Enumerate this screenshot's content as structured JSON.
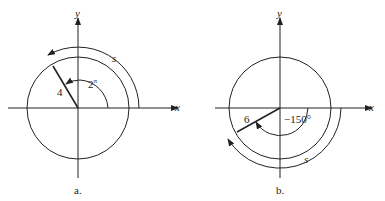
{
  "figure_a": {
    "caption": "a.",
    "x_label": "x",
    "y_label": "y",
    "radius_label": "4",
    "angle_label": "2",
    "angle_sup": "π",
    "arc_label": "s",
    "direction": "counterclockwise"
  },
  "figure_b": {
    "caption": "b.",
    "x_label": "x",
    "y_label": "y",
    "radius_label": "6",
    "angle_label": "−150°",
    "arc_label": "s",
    "direction": "clockwise"
  },
  "colors": {
    "ink": "#222222",
    "background": "#ffffff"
  }
}
